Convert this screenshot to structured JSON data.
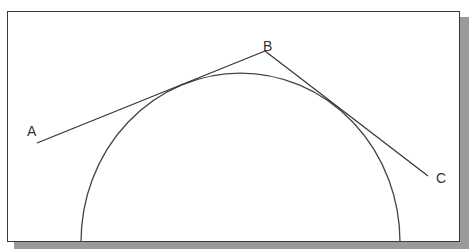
{
  "diagram": {
    "points": [
      {
        "id": "A",
        "label": "A",
        "x": 37,
        "y": 143,
        "label_x": 27,
        "label_y": 136
      },
      {
        "id": "B",
        "label": "B",
        "x": 265,
        "y": 51,
        "label_x": 263,
        "label_y": 51
      },
      {
        "id": "C",
        "label": "C",
        "x": 428,
        "y": 176,
        "label_x": 436,
        "label_y": 183
      }
    ],
    "lines": [
      {
        "id": "AB",
        "from": "A",
        "to": "B"
      },
      {
        "id": "BC",
        "from": "B",
        "to": "C"
      }
    ],
    "arc": {
      "cx": 240,
      "cy": 243,
      "r": 170,
      "start_x": 81,
      "end_x": 400,
      "bottom_y": 242
    },
    "colors": {
      "line": "#333333",
      "arc": "#444444",
      "frame": "#3a3a3a",
      "shadow": "#9a9a9a",
      "background": "#ffffff"
    }
  }
}
